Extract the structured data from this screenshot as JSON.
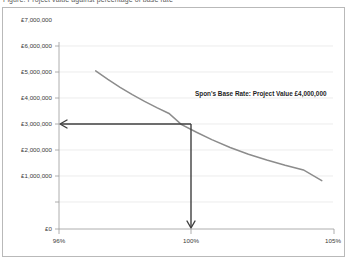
{
  "figure": {
    "title_fragment": "Figure: Project value against percentage of base rate",
    "background_color": "#ffffff",
    "border_color": "#b9b9b9"
  },
  "chart_data": {
    "type": "line",
    "title": "",
    "xlabel": "",
    "ylabel": "",
    "xlim": [
      96,
      105
    ],
    "ylim": [
      0,
      7000000
    ],
    "grid": true,
    "legend": "none",
    "curve_color": "#8c8c8c",
    "annotation_color": "#3f3f3f",
    "x_tick_labels": [
      "96%",
      "100%",
      "105%"
    ],
    "x_tick_values": [
      96,
      100,
      105
    ],
    "y_tick_labels": [
      "£7,000,000",
      "£6,000,000",
      "£5,000,000",
      "£4,000,000",
      "£3,000,000",
      "£2,000,000",
      "£1,000,000",
      "£0"
    ],
    "y_tick_values": [
      7000000,
      6000000,
      5000000,
      4000000,
      3000000,
      2000000,
      1000000,
      0
    ],
    "series": [
      {
        "name": "Project value curve",
        "x": [
          97.2,
          97.6,
          98.0,
          98.4,
          98.8,
          99.2,
          99.6,
          100.0,
          100.5,
          101.0,
          101.6,
          102.2,
          102.8,
          103.4,
          104.0,
          104.6
        ],
        "y": [
          6050000,
          5720000,
          5420000,
          5140000,
          4880000,
          4640000,
          4420000,
          4000000,
          3700000,
          3420000,
          3120000,
          2860000,
          2640000,
          2440000,
          2260000,
          1850000
        ]
      }
    ],
    "annotations": [
      {
        "name": "base-rate-callout",
        "text": "Spon's Base Rate: Project Value £4,000,000",
        "x": 100.0,
        "y": 4000000
      }
    ],
    "markers": [
      {
        "name": "horizontal-value-arrow",
        "from_x": 100.0,
        "to_x": 96.0,
        "y": 4000000,
        "direction": "left"
      },
      {
        "name": "vertical-rate-arrow",
        "x": 100.0,
        "from_y": 4000000,
        "to_y": 0,
        "direction": "down"
      }
    ]
  }
}
